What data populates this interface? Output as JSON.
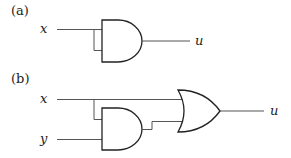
{
  "diagram": {
    "a": {
      "label": "(a)",
      "inputs": [
        "x"
      ],
      "output": "u",
      "gates": [
        "AND"
      ]
    },
    "b": {
      "label": "(b)",
      "inputs": [
        "x",
        "y"
      ],
      "output": "u",
      "gates": [
        "AND",
        "OR"
      ]
    }
  }
}
